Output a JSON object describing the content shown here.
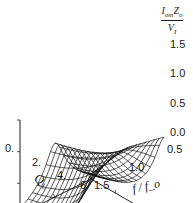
{
  "chart_data": {
    "type": "surface3d",
    "title": "",
    "zlabel": "I_om Z_o / V_I",
    "zlabel_num": "I",
    "zlabel_num_sub": "om",
    "zlabel_num2": "Z",
    "zlabel_num2_sub": "o",
    "zlabel_den": "V",
    "zlabel_den_sub": "I",
    "xlabel": "Q_L",
    "xlabel_main": "Q",
    "xlabel_sub": "L",
    "ylabel": "f / f_o",
    "x_ticks": [
      "0.",
      "2.",
      "4.",
      "6."
    ],
    "y_ticks": [
      "0.5",
      "1.0",
      "1.5"
    ],
    "z_ticks": [
      "0.0",
      "0.5",
      "1.0",
      "1.5"
    ],
    "xlim": [
      0,
      6
    ],
    "ylim": [
      0.5,
      1.5
    ],
    "zlim": [
      0,
      1.5
    ],
    "grid": false,
    "mesh_lines": 16
  }
}
